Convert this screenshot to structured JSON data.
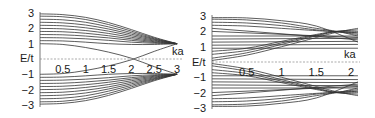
{
  "chart_data": [
    {
      "type": "line",
      "title": "",
      "xlabel": "ka",
      "ylabel": "E/t",
      "xlim": [
        0,
        3
      ],
      "ylim": [
        -3,
        3
      ],
      "x_ticks": [
        "0.5",
        "1",
        "1.5",
        "2",
        "2.5",
        "3"
      ],
      "y_ticks": [
        "3",
        "2",
        "1",
        "-1",
        "-2",
        "-3"
      ],
      "grid": false,
      "legend": "none",
      "description": "Band structure: upper bands start between E/t=1 and 3 at ka=0 and converge to E/t=1 at ka=3; mirrored lower bands converge to -1; two inner bands cross near ka=2 at E=0",
      "series": [
        {
          "name": "band+1.0",
          "x": [
            0,
            0.5,
            1,
            1.5,
            2,
            2.5,
            3
          ],
          "values": [
            1.0,
            0.95,
            0.75,
            0.45,
            0.05,
            -0.5,
            -1.0
          ]
        },
        {
          "name": "band-1.0",
          "x": [
            0,
            0.5,
            1,
            1.5,
            2,
            2.5,
            3
          ],
          "values": [
            -1.0,
            -0.95,
            -0.75,
            -0.45,
            -0.05,
            0.5,
            1.0
          ]
        },
        {
          "name": "band+1.2",
          "x": [
            0,
            0.5,
            1,
            1.5,
            2,
            2.5,
            3
          ],
          "values": [
            1.2,
            1.18,
            1.1,
            1.0,
            0.95,
            0.95,
            1.0
          ]
        },
        {
          "name": "band+1.4",
          "x": [
            0,
            0.5,
            1,
            1.5,
            2,
            2.5,
            3
          ],
          "values": [
            1.4,
            1.38,
            1.32,
            1.22,
            1.1,
            1.03,
            1.0
          ]
        },
        {
          "name": "band+1.6",
          "x": [
            0,
            0.5,
            1,
            1.5,
            2,
            2.5,
            3
          ],
          "values": [
            1.6,
            1.58,
            1.5,
            1.38,
            1.22,
            1.08,
            1.0
          ]
        },
        {
          "name": "band+1.8",
          "x": [
            0,
            0.5,
            1,
            1.5,
            2,
            2.5,
            3
          ],
          "values": [
            1.8,
            1.78,
            1.68,
            1.52,
            1.32,
            1.13,
            1.0
          ]
        },
        {
          "name": "band+2.0",
          "x": [
            0,
            0.5,
            1,
            1.5,
            2,
            2.5,
            3
          ],
          "values": [
            2.0,
            1.97,
            1.86,
            1.67,
            1.42,
            1.18,
            1.0
          ]
        },
        {
          "name": "band+2.2",
          "x": [
            0,
            0.5,
            1,
            1.5,
            2,
            2.5,
            3
          ],
          "values": [
            2.2,
            2.17,
            2.04,
            1.82,
            1.52,
            1.23,
            1.0
          ]
        },
        {
          "name": "band+2.4",
          "x": [
            0,
            0.5,
            1,
            1.5,
            2,
            2.5,
            3
          ],
          "values": [
            2.4,
            2.36,
            2.22,
            1.96,
            1.62,
            1.28,
            1.0
          ]
        },
        {
          "name": "band+2.6",
          "x": [
            0,
            0.5,
            1,
            1.5,
            2,
            2.5,
            3
          ],
          "values": [
            2.6,
            2.56,
            2.4,
            2.1,
            1.72,
            1.32,
            1.0
          ]
        },
        {
          "name": "band+2.8",
          "x": [
            0,
            0.5,
            1,
            1.5,
            2,
            2.5,
            3
          ],
          "values": [
            2.8,
            2.76,
            2.58,
            2.25,
            1.82,
            1.37,
            1.0
          ]
        },
        {
          "name": "band+3.0",
          "x": [
            0,
            0.5,
            1,
            1.5,
            2,
            2.5,
            3
          ],
          "values": [
            2.95,
            2.9,
            2.72,
            2.38,
            1.92,
            1.42,
            1.0
          ]
        }
      ],
      "mirror_bands": true
    },
    {
      "type": "line",
      "title": "",
      "xlabel": "ka",
      "ylabel": "E/t",
      "xlim": [
        0,
        2.1
      ],
      "ylim": [
        -3,
        3
      ],
      "x_ticks": [
        "0.5",
        "1",
        "1.5",
        "2"
      ],
      "y_ticks": [
        "3",
        "2",
        "1",
        "-1",
        "-2",
        "-3"
      ],
      "grid": false,
      "legend": "none",
      "description": "Band structure with many bands; flat bands between 0.5 and 3 (and -0.5 to -3), plus crossing bands rising from near 0 at ka=0 to about 2 at ka≈1.8, and falling bands from about 2.8 crossing near ka≈1.8",
      "series": [
        {
          "name": "rising-1",
          "x": [
            0,
            0.5,
            1,
            1.5,
            1.8,
            2.1
          ],
          "values": [
            0.1,
            0.45,
            1.0,
            1.6,
            1.95,
            2.2
          ]
        },
        {
          "name": "rising-2",
          "x": [
            0,
            0.5,
            1,
            1.5,
            1.8,
            2.1
          ],
          "values": [
            0.25,
            0.6,
            1.15,
            1.7,
            2.0,
            2.1
          ]
        },
        {
          "name": "rising-3",
          "x": [
            0,
            0.5,
            1,
            1.5,
            1.8,
            2.1
          ],
          "values": [
            0.5,
            0.75,
            1.25,
            1.75,
            2.0,
            2.0
          ]
        },
        {
          "name": "rising-4",
          "x": [
            0,
            0.5,
            1,
            1.5,
            1.8,
            2.1
          ],
          "values": [
            0.7,
            0.9,
            1.35,
            1.8,
            2.0,
            1.9
          ]
        },
        {
          "name": "falling-1",
          "x": [
            0,
            0.5,
            1,
            1.5,
            1.8,
            2.1
          ],
          "values": [
            2.8,
            2.75,
            2.55,
            2.2,
            2.0,
            1.7
          ]
        },
        {
          "name": "falling-2",
          "x": [
            0,
            0.5,
            1,
            1.5,
            1.8,
            2.1
          ],
          "values": [
            2.6,
            2.55,
            2.38,
            2.1,
            1.98,
            1.8
          ]
        },
        {
          "name": "falling-3",
          "x": [
            0,
            0.5,
            1,
            1.5,
            1.8,
            2.1
          ],
          "values": [
            2.4,
            2.35,
            2.2,
            2.05,
            1.97,
            1.9
          ]
        },
        {
          "name": "flat-0.9",
          "x": [
            0,
            2.1
          ],
          "values": [
            0.9,
            0.9
          ]
        },
        {
          "name": "flat-1.1",
          "x": [
            0,
            2.1
          ],
          "values": [
            1.1,
            1.15
          ]
        },
        {
          "name": "flat-1.3",
          "x": [
            0,
            2.1
          ],
          "values": [
            1.3,
            1.35
          ]
        },
        {
          "name": "flat-1.5",
          "x": [
            0,
            2.1
          ],
          "values": [
            1.5,
            1.55
          ]
        },
        {
          "name": "flat-1.7",
          "x": [
            0,
            2.1
          ],
          "values": [
            1.7,
            1.7
          ]
        },
        {
          "name": "flat-2.0",
          "x": [
            0,
            2.1
          ],
          "values": [
            2.0,
            1.6
          ]
        },
        {
          "name": "flat-2.2",
          "x": [
            0,
            2.1
          ],
          "values": [
            2.2,
            1.45
          ]
        },
        {
          "name": "flat-2.9",
          "x": [
            0,
            0.5,
            1,
            1.5,
            2.1
          ],
          "values": [
            2.9,
            2.88,
            2.7,
            2.35,
            1.3
          ]
        }
      ],
      "mirror_bands": true
    }
  ],
  "left_panel": {
    "ylabel": "E/t",
    "xlabel": "ka",
    "y_ticks": [
      {
        "label": "3",
        "v": 3
      },
      {
        "label": "2",
        "v": 2
      },
      {
        "label": "1",
        "v": 1
      },
      {
        "label": "−1",
        "v": -1
      },
      {
        "label": "−2",
        "v": -2
      },
      {
        "label": "−3",
        "v": -3
      }
    ],
    "x_ticks": [
      {
        "label": "0.5",
        "v": 0.5
      },
      {
        "label": "1",
        "v": 1
      },
      {
        "label": "1.5",
        "v": 1.5
      },
      {
        "label": "2",
        "v": 2
      },
      {
        "label": "2.5",
        "v": 2.5
      },
      {
        "label": "3",
        "v": 3
      }
    ]
  },
  "right_panel": {
    "ylabel": "E/t",
    "xlabel": "ka",
    "y_ticks": [
      {
        "label": "3",
        "v": 3
      },
      {
        "label": "2",
        "v": 2
      },
      {
        "label": "1",
        "v": 1
      },
      {
        "label": "−1",
        "v": -1
      },
      {
        "label": "−2",
        "v": -2
      },
      {
        "label": "−3",
        "v": -3
      }
    ],
    "x_ticks": [
      {
        "label": "0.5",
        "v": 0.5
      },
      {
        "label": "1",
        "v": 1
      },
      {
        "label": "1.5",
        "v": 1.5
      },
      {
        "label": "2",
        "v": 2
      }
    ]
  },
  "colors": {
    "line": "#333333",
    "axis": "#555555",
    "text": "#1a1a1a"
  }
}
